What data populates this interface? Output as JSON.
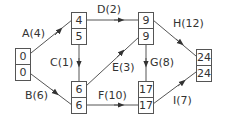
{
  "diagram": {
    "type": "activity-network",
    "nodes": [
      {
        "id": "n1",
        "early": "0",
        "late": "0"
      },
      {
        "id": "n2",
        "early": "4",
        "late": "5"
      },
      {
        "id": "n3",
        "early": "6",
        "late": "6"
      },
      {
        "id": "n4",
        "early": "9",
        "late": "9"
      },
      {
        "id": "n5",
        "early": "17",
        "late": "17"
      },
      {
        "id": "n6",
        "early": "24",
        "late": "24"
      }
    ],
    "edges": [
      {
        "label": "A(4)",
        "from": "n1",
        "to": "n2"
      },
      {
        "label": "B(6)",
        "from": "n1",
        "to": "n3"
      },
      {
        "label": "C(1)",
        "from": "n2",
        "to": "n3"
      },
      {
        "label": "D(2)",
        "from": "n2",
        "to": "n4"
      },
      {
        "label": "E(3)",
        "from": "n3",
        "to": "n4"
      },
      {
        "label": "F(10)",
        "from": "n3",
        "to": "n5"
      },
      {
        "label": "G(8)",
        "from": "n4",
        "to": "n5"
      },
      {
        "label": "H(12)",
        "from": "n4",
        "to": "n6"
      },
      {
        "label": "I(7)",
        "from": "n5",
        "to": "n6"
      }
    ],
    "colors": {
      "line": "#555555",
      "text": "#333333"
    }
  }
}
